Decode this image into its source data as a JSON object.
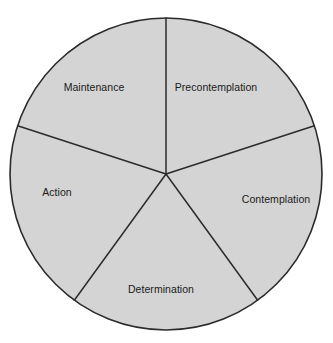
{
  "diagram": {
    "type": "wheel",
    "background_color": "#ffffff",
    "sector_fill_color": "#d4d4d4",
    "outline_color": "#2b2b2b",
    "label_color": "#1a1a1a",
    "center": {
      "x": 166,
      "y": 174
    },
    "radius": 156,
    "sector_count": 5,
    "sectors": [
      {
        "id": "precontemplation",
        "label": "Precontemplation",
        "start_angle_deg": 0,
        "end_angle_deg": 72,
        "label_x": 216,
        "label_y": 87
      },
      {
        "id": "contemplation",
        "label": "Contemplation",
        "start_angle_deg": 72,
        "end_angle_deg": 144,
        "label_x": 276,
        "label_y": 199
      },
      {
        "id": "determination",
        "label": "Determination",
        "start_angle_deg": 144,
        "end_angle_deg": 216,
        "label_x": 161,
        "label_y": 289
      },
      {
        "id": "action",
        "label": "Action",
        "start_angle_deg": 216,
        "end_angle_deg": 288,
        "label_x": 57,
        "label_y": 192
      },
      {
        "id": "maintenance",
        "label": "Maintenance",
        "start_angle_deg": 288,
        "end_angle_deg": 360,
        "label_x": 94,
        "label_y": 87
      }
    ]
  }
}
